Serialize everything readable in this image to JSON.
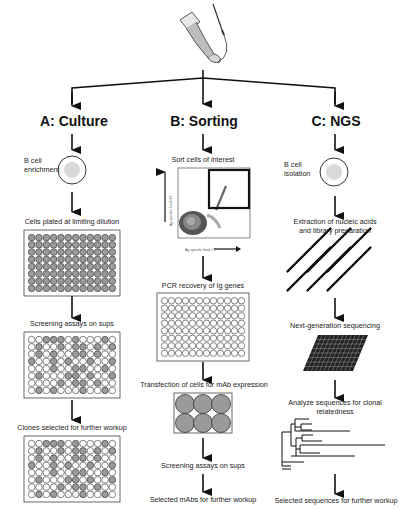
{
  "figure": {
    "source_icon": "arm-with-syringe-icon",
    "columns": [
      {
        "id": "A",
        "title": "A: Culture",
        "steps": [
          {
            "label": "B cell\nenrichment",
            "label_lines": [
              "B cell",
              "enrichment"
            ],
            "icon": "b-cell-icon"
          },
          {
            "label": "Cells plated at limiting dilution",
            "icon": "96-well-plate-filled-icon"
          },
          {
            "label": "Screening assays on sups",
            "icon": "96-well-plate-screened-icon"
          },
          {
            "label": "Clones selected for further workup",
            "icon": "96-well-plate-selected-icon"
          }
        ]
      },
      {
        "id": "B",
        "title": "B: Sorting",
        "steps": [
          {
            "label": "Sort cells of interest",
            "icon": "flow-cytometry-plot-icon"
          },
          {
            "label": "PCR recovery of Ig genes",
            "icon": "96-well-plate-empty-icon"
          },
          {
            "label": "Transfection of cells for mAb expression",
            "icon": "6-well-plate-icon"
          },
          {
            "label": "Screening assays on sups",
            "icon": "arrow-icon"
          },
          {
            "label": "Selected mAbs for further workup",
            "icon": "arrow-icon"
          }
        ]
      },
      {
        "id": "C",
        "title": "C: NGS",
        "steps": [
          {
            "label": "B cell\nisolation",
            "label_lines": [
              "B cell",
              "isolation"
            ],
            "icon": "b-cell-icon"
          },
          {
            "label": "Extraction of nucleic acids and library preparation",
            "label_lines": [
              "Extraction of nucleic acids",
              "and library preparation"
            ],
            "icon": "dna-helix-icon"
          },
          {
            "label": "Next-generation sequencing",
            "icon": "sequencing-chip-icon"
          },
          {
            "label": "Analyze sequences for clonal relatedness",
            "label_lines": [
              "Analyze sequences for clonal",
              "relatedness"
            ],
            "icon": "phylogenetic-tree-icon"
          },
          {
            "label": "Selected sequences for further workup",
            "icon": "arrow-icon"
          }
        ]
      }
    ],
    "flow_plot": {
      "x_label": "Ag specific hook #1",
      "y_label": "Ag specific hook #2",
      "ticks": [
        "10^1",
        "10^2",
        "10^3",
        "10^4"
      ]
    },
    "plates": {
      "rows": 8,
      "cols": 12,
      "screening_positive": [
        [
          0,
          0,
          1,
          1,
          1,
          0,
          1,
          0,
          0,
          0,
          1,
          0
        ],
        [
          0,
          1,
          0,
          0,
          1,
          0,
          1,
          1,
          0,
          1,
          0,
          1
        ],
        [
          0,
          1,
          0,
          1,
          0,
          0,
          1,
          1,
          0,
          1,
          0,
          0
        ],
        [
          1,
          0,
          0,
          1,
          0,
          1,
          0,
          0,
          1,
          0,
          0,
          1
        ],
        [
          0,
          0,
          0,
          1,
          0,
          0,
          1,
          1,
          0,
          0,
          1,
          0
        ],
        [
          0,
          1,
          0,
          0,
          0,
          1,
          1,
          0,
          1,
          0,
          0,
          1
        ],
        [
          0,
          0,
          0,
          0,
          1,
          0,
          1,
          1,
          0,
          1,
          0,
          0
        ],
        [
          0,
          1,
          0,
          1,
          0,
          0,
          0,
          1,
          0,
          0,
          1,
          0
        ]
      ],
      "colors": {
        "filled": "#9a9a9a",
        "empty": "#ffffff",
        "outline": "#333333"
      }
    },
    "colors": {
      "line": "#111111",
      "text": "#222222",
      "cell_fill": "#d9d9d9"
    }
  }
}
